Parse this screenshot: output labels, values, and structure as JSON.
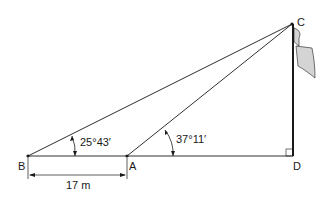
{
  "diagram": {
    "points": {
      "B": {
        "label": "B",
        "x": 28,
        "y": 156
      },
      "A": {
        "label": "A",
        "x": 127,
        "y": 156
      },
      "D": {
        "label": "D",
        "x": 293,
        "y": 156
      },
      "C": {
        "label": "C",
        "x": 292,
        "y": 24
      }
    },
    "angles": {
      "at_B": "25°43′",
      "at_A": "37°11′"
    },
    "distance_BA": "17 m",
    "right_angle_at": "D",
    "colors": {
      "line": "#1a1a1a",
      "flag_fill": "#d4d4d4"
    }
  }
}
